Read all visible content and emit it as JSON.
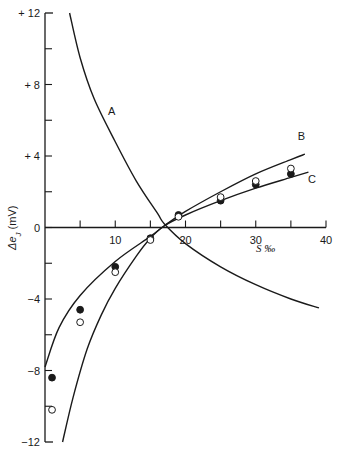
{
  "chart_data": {
    "type": "line",
    "title": "",
    "xlabel": "S ‰",
    "ylabel": "Δe_J (mV)",
    "xlim": [
      0,
      40
    ],
    "ylim": [
      -12,
      12
    ],
    "x_ticks": [
      0,
      5,
      10,
      15,
      20,
      25,
      30,
      35,
      40
    ],
    "x_tick_labels": [
      {
        "value": 10,
        "label": "10"
      },
      {
        "value": 20,
        "label": "20"
      },
      {
        "value": 30,
        "label": "30"
      },
      {
        "value": 40,
        "label": "40"
      }
    ],
    "y_ticks": [
      -12,
      -10,
      -8,
      -6,
      -4,
      -2,
      0,
      2,
      4,
      6,
      8,
      10,
      12
    ],
    "y_tick_labels": [
      {
        "value": 12,
        "label": "+ 12"
      },
      {
        "value": 8,
        "label": "+ 8"
      },
      {
        "value": 4,
        "label": "+ 4"
      },
      {
        "value": 0,
        "label": "0"
      },
      {
        "value": -4,
        "label": "−4"
      },
      {
        "value": -8,
        "label": "−8"
      },
      {
        "value": -12,
        "label": "−12"
      }
    ],
    "grid": false,
    "legend": "none; curves labelled inline A, B, C",
    "series": [
      {
        "name": "A",
        "kind": "curve",
        "x": [
          3.5,
          5,
          7,
          10,
          13,
          16,
          17,
          20,
          25,
          30,
          35,
          39
        ],
        "y": [
          12,
          9.5,
          7.2,
          4.8,
          2.6,
          0.8,
          0.2,
          -0.9,
          -2.2,
          -3.2,
          -4.0,
          -4.5
        ]
      },
      {
        "name": "B",
        "kind": "curve",
        "x": [
          0,
          2,
          5,
          10,
          15,
          17,
          20,
          25,
          30,
          35,
          37
        ],
        "y": [
          -7.8,
          -5.6,
          -3.8,
          -1.9,
          -0.5,
          0.1,
          0.9,
          2.0,
          3.0,
          3.8,
          4.1
        ]
      },
      {
        "name": "C",
        "kind": "curve",
        "x": [
          2.5,
          4,
          6,
          8,
          10,
          13,
          15,
          17,
          20,
          25,
          30,
          35,
          37.5
        ],
        "y": [
          -12,
          -9.5,
          -6.8,
          -4.9,
          -3.4,
          -1.6,
          -0.6,
          0.1,
          0.7,
          1.5,
          2.2,
          2.8,
          3.1
        ]
      },
      {
        "name": "filled-points",
        "kind": "scatter",
        "marker": "filled-circle",
        "x": [
          1,
          5,
          10,
          15,
          19,
          25,
          30,
          35
        ],
        "y": [
          -8.4,
          -4.6,
          -2.2,
          -0.6,
          0.7,
          1.5,
          2.4,
          3.0
        ]
      },
      {
        "name": "open-points",
        "kind": "scatter",
        "marker": "open-circle",
        "x": [
          1,
          5,
          10,
          15,
          19,
          25,
          30,
          35
        ],
        "y": [
          -10.2,
          -5.3,
          -2.5,
          -0.7,
          0.6,
          1.7,
          2.6,
          3.3
        ]
      }
    ],
    "annotations": [
      {
        "text": "A",
        "x": 9.5,
        "y": 6.3
      },
      {
        "text": "B",
        "x": 36.5,
        "y": 4.9
      },
      {
        "text": "C",
        "x": 38,
        "y": 2.5
      }
    ]
  },
  "labels": {
    "xlabel": "S ‰",
    "ylabel": "Δe",
    "ylabel_sub": "J",
    "ylabel_unit": " (mV)",
    "curve_a": "A",
    "curve_b": "B",
    "curve_c": "C"
  }
}
